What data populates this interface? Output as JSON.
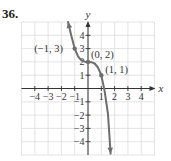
{
  "problem": {
    "number": "36."
  },
  "colors": {
    "grid": "#dcdcdc",
    "axis": "#333333",
    "curve": "#6e6e6e",
    "text": "#333333"
  },
  "chart_data": {
    "type": "line",
    "title": "",
    "xlabel": "x",
    "ylabel": "y",
    "xlim": [
      -5,
      5
    ],
    "ylim": [
      -5,
      5
    ],
    "grid": true,
    "x_ticks": [
      -4,
      -3,
      -2,
      -1,
      1,
      2,
      3,
      4
    ],
    "x_tick_labels": [
      "−4",
      "−3",
      "−2",
      "−1",
      "1",
      "2",
      "3",
      "4"
    ],
    "y_ticks": [
      -4,
      -3,
      -2,
      -1,
      1,
      2,
      3,
      4
    ],
    "y_tick_labels": [
      "−4",
      "−3",
      "−2",
      "−1",
      "1",
      "2",
      "3",
      "4"
    ],
    "series": [
      {
        "name": "f(x) = -x^3 + 2",
        "arrows_both_ends": true,
        "x": [
          -1.5,
          -1.25,
          -1.0,
          -0.75,
          -0.5,
          -0.25,
          0,
          0.25,
          0.5,
          0.75,
          1.0,
          1.25,
          1.5,
          1.7
        ],
        "y": [
          5.0,
          3.95,
          3.0,
          2.42,
          2.12,
          2.02,
          2.0,
          1.98,
          1.88,
          1.58,
          1.0,
          -0.2,
          -1.9,
          -4.9
        ]
      }
    ],
    "labeled_points": [
      {
        "x": -1,
        "y": 3,
        "label": "(−1, 3)"
      },
      {
        "x": 0,
        "y": 2,
        "label": "(0, 2)"
      },
      {
        "x": 1,
        "y": 1,
        "label": "(1, 1)"
      }
    ],
    "annotations": []
  }
}
